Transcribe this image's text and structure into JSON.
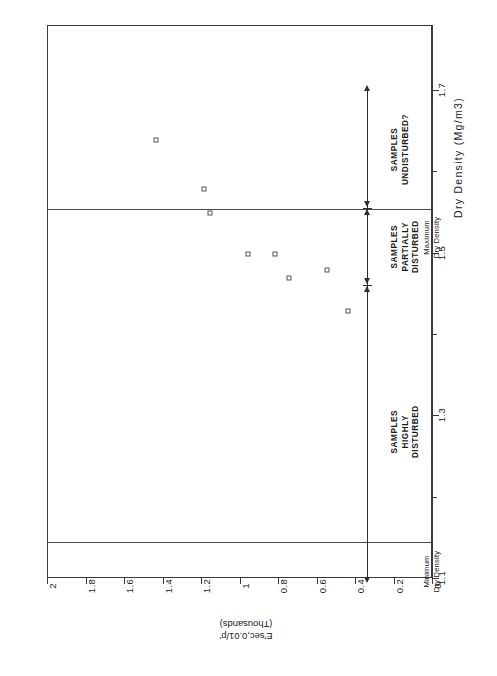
{
  "chart_data": {
    "type": "scatter",
    "title": "NORMALISED DRAINED STIFFNESS AT LOCAL AXIAL STRAIN OF 0.01% AGAINST DRY DENSITY FOR WIRELINE CORE SAMPLES OF THANET BEDS",
    "title_line1": "NORMALISED DRAINED STIFFNESS AT LOCAL AXIAL STRAIN OF 0.01%",
    "title_line2": "AGAINST DRY DENSITY FOR WIRELINE CORE SAMPLES OF THANET BEDS",
    "xlabel": "Dry Density (Mg/m3)",
    "ylabel": "E'sec,0.01/p'",
    "ylabel_units": "(Thousands)",
    "xlim": [
      1.1,
      1.78
    ],
    "ylim": [
      0,
      2
    ],
    "xticks": [
      1.1,
      1.3,
      1.5,
      1.7
    ],
    "xtick_labels": [
      "1.1",
      "1.3",
      "1.5",
      "1.7"
    ],
    "xminor_ticks": [
      1.2,
      1.4,
      1.6
    ],
    "yticks": [
      0,
      0.2,
      0.4,
      0.6,
      0.8,
      1,
      1.2,
      1.4,
      1.6,
      1.8,
      2
    ],
    "ytick_labels": [
      "0",
      "0.2",
      "0.4",
      "0.6",
      "0.8",
      "1",
      "1.2",
      "1.4",
      "1.6",
      "1.8",
      "2"
    ],
    "grid": false,
    "legend": "none",
    "marker": "open-square",
    "points": [
      {
        "x": 1.64,
        "y": 1.44
      },
      {
        "x": 1.58,
        "y": 1.19
      },
      {
        "x": 1.55,
        "y": 1.16
      },
      {
        "x": 1.5,
        "y": 0.96
      },
      {
        "x": 1.5,
        "y": 0.82
      },
      {
        "x": 1.47,
        "y": 0.75
      },
      {
        "x": 1.48,
        "y": 0.55
      },
      {
        "x": 1.43,
        "y": 0.44
      }
    ],
    "reference_lines": [
      {
        "label": "Minimum Dry Density",
        "x": 1.145
      },
      {
        "label": "Maximum Dry Density",
        "x": 1.555
      }
    ],
    "annotations": [
      {
        "name": "minimum-dry-density",
        "line1": "Minimum",
        "line2": "Dry Density"
      },
      {
        "name": "maximum-dry-density",
        "line1": "Maximum",
        "line2": "Dry Density"
      }
    ],
    "zones": [
      {
        "name": "samples-highly-disturbed",
        "line1": "SAMPLES",
        "line2": "HIGHLY",
        "line3": "DISTURBED",
        "from": 1.1,
        "to": 1.46
      },
      {
        "name": "samples-partially-disturbed",
        "line1": "SAMPLES",
        "line2": "PARTIALLY",
        "line3": "DISTURBED",
        "from": 1.46,
        "to": 1.555
      },
      {
        "name": "samples-undisturbed",
        "line1": "SAMPLES",
        "line2": "UNDISTURBED?",
        "line3": "",
        "from": 1.555,
        "to": 1.7
      }
    ]
  }
}
